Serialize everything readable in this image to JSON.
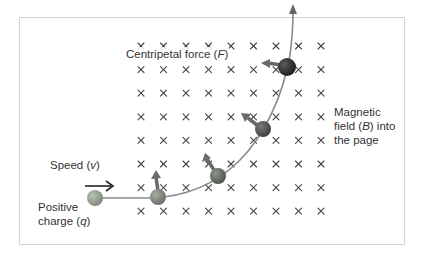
{
  "diagram": {
    "labels": {
      "centripetal_force": "Centripetal force",
      "centripetal_force_symbol": "F",
      "speed": "Speed",
      "speed_symbol": "v",
      "charge_line1": "Positive",
      "charge_line2": "charge",
      "charge_symbol": "q",
      "field_line1": "Magnetic",
      "field_line2a": "field",
      "field_symbol": "B",
      "field_line2b": "into",
      "field_line3": "the page"
    },
    "field_grid": {
      "symbol": "×",
      "columns": 9,
      "rows": 8,
      "x_start": 141,
      "x_step": 22.5,
      "y_start": 46,
      "y_step": 23.6
    },
    "colors": {
      "border": "#d4d4d4",
      "cross": "#444444",
      "path": "#8a8a8a",
      "force_arrow": "#666666",
      "text": "#333333"
    },
    "particles": [
      {
        "x": 95,
        "y": 198,
        "r": 8,
        "color": "#8f9a8a"
      },
      {
        "x": 158,
        "y": 197,
        "r": 8,
        "color": "#7a8277"
      },
      {
        "x": 218,
        "y": 176,
        "r": 8,
        "color": "#5f655e"
      },
      {
        "x": 263,
        "y": 129,
        "r": 8,
        "color": "#4a4d4a"
      },
      {
        "x": 287,
        "y": 67,
        "r": 9,
        "color": "#2e2e2e"
      }
    ]
  }
}
